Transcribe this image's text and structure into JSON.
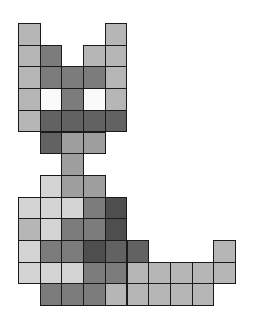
{
  "figure": {
    "origin": {
      "x": 18,
      "y": 23
    },
    "cell_size": 21.7,
    "palette": {
      "W": "#fafafa",
      "L": "#d4d4d4",
      "M": "#b6b6b6",
      "G": "#9e9e9e",
      "D": "#7c7c7c",
      "K": "#626262",
      "X": "#4e4e4e"
    },
    "cells": [
      [
        0,
        0,
        "M"
      ],
      [
        0,
        4,
        "M"
      ],
      [
        1,
        0,
        "M"
      ],
      [
        1,
        1,
        "D"
      ],
      [
        1,
        3,
        "M"
      ],
      [
        1,
        4,
        "M"
      ],
      [
        2,
        0,
        "M"
      ],
      [
        2,
        1,
        "D"
      ],
      [
        2,
        2,
        "D"
      ],
      [
        2,
        3,
        "D"
      ],
      [
        2,
        4,
        "M"
      ],
      [
        3,
        0,
        "M"
      ],
      [
        3,
        1,
        "W"
      ],
      [
        3,
        2,
        "D"
      ],
      [
        3,
        3,
        "W"
      ],
      [
        3,
        4,
        "M"
      ],
      [
        4,
        0,
        "M"
      ],
      [
        4,
        1,
        "K"
      ],
      [
        4,
        2,
        "K"
      ],
      [
        4,
        3,
        "K"
      ],
      [
        4,
        4,
        "K"
      ],
      [
        5,
        1,
        "K"
      ],
      [
        5,
        2,
        "G"
      ],
      [
        5,
        3,
        "G"
      ],
      [
        6,
        2,
        "G"
      ],
      [
        7,
        1,
        "L"
      ],
      [
        7,
        2,
        "G"
      ],
      [
        7,
        3,
        "G"
      ],
      [
        8,
        0,
        "L"
      ],
      [
        8,
        1,
        "L"
      ],
      [
        8,
        2,
        "L"
      ],
      [
        8,
        3,
        "D"
      ],
      [
        8,
        4,
        "X"
      ],
      [
        9,
        0,
        "M"
      ],
      [
        9,
        1,
        "L"
      ],
      [
        9,
        2,
        "D"
      ],
      [
        9,
        3,
        "D"
      ],
      [
        9,
        4,
        "X"
      ],
      [
        10,
        0,
        "L"
      ],
      [
        10,
        1,
        "D"
      ],
      [
        10,
        2,
        "D"
      ],
      [
        10,
        3,
        "X"
      ],
      [
        10,
        4,
        "K"
      ],
      [
        10,
        5,
        "K"
      ],
      [
        10,
        9,
        "M"
      ],
      [
        11,
        0,
        "L"
      ],
      [
        11,
        1,
        "L"
      ],
      [
        11,
        2,
        "L"
      ],
      [
        11,
        3,
        "D"
      ],
      [
        11,
        4,
        "D"
      ],
      [
        11,
        5,
        "M"
      ],
      [
        11,
        6,
        "M"
      ],
      [
        11,
        7,
        "M"
      ],
      [
        11,
        8,
        "M"
      ],
      [
        11,
        9,
        "M"
      ],
      [
        12,
        1,
        "D"
      ],
      [
        12,
        2,
        "D"
      ],
      [
        12,
        3,
        "D"
      ],
      [
        12,
        4,
        "M"
      ],
      [
        12,
        5,
        "M"
      ],
      [
        12,
        6,
        "M"
      ],
      [
        12,
        7,
        "M"
      ],
      [
        12,
        8,
        "M"
      ]
    ]
  }
}
